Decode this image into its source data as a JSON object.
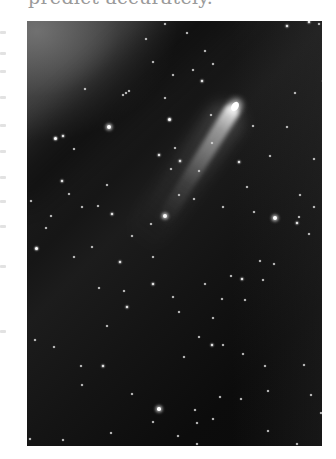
{
  "document": {
    "top_text": "predict accurately.",
    "text_color": "#9a9a9a",
    "margin_fragments_y": [
      31,
      52,
      70,
      96,
      124,
      150,
      176,
      200,
      225,
      265,
      330
    ]
  },
  "photo": {
    "subject": "comet in starry night sky",
    "alt": "Photograph of a comet with a long tail against a dark star field",
    "position": {
      "left": 27,
      "top": 21,
      "width": 295,
      "height": 425
    },
    "colors": {
      "sky_dark": "#0a0a0a",
      "glow_top_left": "#787878",
      "star": "#ffffff"
    },
    "comet": {
      "head": {
        "x": 208,
        "y": 85
      },
      "tail_angle_deg": 122,
      "tail_length": 140
    },
    "stars": [
      {
        "x": 82,
        "y": 106,
        "r": 2.2
      },
      {
        "x": 138,
        "y": 195,
        "r": 2.4
      },
      {
        "x": 138,
        "y": 3,
        "r": 1.2
      },
      {
        "x": 58,
        "y": 68,
        "r": 0.9
      },
      {
        "x": 160,
        "y": 12,
        "r": 1.2
      },
      {
        "x": 102,
        "y": 70,
        "r": 1.0
      },
      {
        "x": 99,
        "y": 72,
        "r": 1.0
      },
      {
        "x": 96,
        "y": 74,
        "r": 1.0
      },
      {
        "x": 119,
        "y": 18,
        "r": 1.0
      },
      {
        "x": 146,
        "y": 54,
        "r": 1.2
      },
      {
        "x": 178,
        "y": 30,
        "r": 1.1
      },
      {
        "x": 186,
        "y": 43,
        "r": 0.9
      },
      {
        "x": 175,
        "y": 60,
        "r": 1.3
      },
      {
        "x": 166,
        "y": 49,
        "r": 1.0
      },
      {
        "x": 126,
        "y": 41,
        "r": 1.0
      },
      {
        "x": 138,
        "y": 77,
        "r": 1.0
      },
      {
        "x": 142,
        "y": 98,
        "r": 1.5
      },
      {
        "x": 148,
        "y": 127,
        "r": 1.1
      },
      {
        "x": 132,
        "y": 134,
        "r": 1.3
      },
      {
        "x": 144,
        "y": 148,
        "r": 1.2
      },
      {
        "x": 152,
        "y": 174,
        "r": 1.0
      },
      {
        "x": 172,
        "y": 150,
        "r": 1.0
      },
      {
        "x": 28,
        "y": 117,
        "r": 1.5
      },
      {
        "x": 36,
        "y": 115,
        "r": 1.3
      },
      {
        "x": 47,
        "y": 128,
        "r": 1.1
      },
      {
        "x": 35,
        "y": 160,
        "r": 1.3
      },
      {
        "x": 42,
        "y": 173,
        "r": 1.1
      },
      {
        "x": 55,
        "y": 186,
        "r": 1.1
      },
      {
        "x": 4,
        "y": 180,
        "r": 1.2
      },
      {
        "x": 24,
        "y": 195,
        "r": 1.0
      },
      {
        "x": 71,
        "y": 185,
        "r": 1.2
      },
      {
        "x": 80,
        "y": 164,
        "r": 1.0
      },
      {
        "x": 85,
        "y": 193,
        "r": 1.3
      },
      {
        "x": 105,
        "y": 215,
        "r": 1.2
      },
      {
        "x": 93,
        "y": 241,
        "r": 1.3
      },
      {
        "x": 19,
        "y": 207,
        "r": 1.1
      },
      {
        "x": 9,
        "y": 227,
        "r": 1.5
      },
      {
        "x": 47,
        "y": 236,
        "r": 1.0
      },
      {
        "x": 65,
        "y": 226,
        "r": 1.0
      },
      {
        "x": 126,
        "y": 236,
        "r": 1.1
      },
      {
        "x": 124,
        "y": 203,
        "r": 1.0
      },
      {
        "x": 72,
        "y": 267,
        "r": 1.2
      },
      {
        "x": 97,
        "y": 270,
        "r": 1.1
      },
      {
        "x": 100,
        "y": 286,
        "r": 1.4
      },
      {
        "x": 126,
        "y": 263,
        "r": 1.3
      },
      {
        "x": 146,
        "y": 276,
        "r": 1.1
      },
      {
        "x": 152,
        "y": 291,
        "r": 1.0
      },
      {
        "x": 178,
        "y": 263,
        "r": 1.1
      },
      {
        "x": 186,
        "y": 297,
        "r": 1.2
      },
      {
        "x": 195,
        "y": 278,
        "r": 1.1
      },
      {
        "x": 215,
        "y": 258,
        "r": 1.3
      },
      {
        "x": 236,
        "y": 259,
        "r": 1.0
      },
      {
        "x": 248,
        "y": 197,
        "r": 2.0
      },
      {
        "x": 270,
        "y": 202,
        "r": 1.3
      },
      {
        "x": 227,
        "y": 191,
        "r": 1.0
      },
      {
        "x": 287,
        "y": 186,
        "r": 1.1
      },
      {
        "x": 273,
        "y": 174,
        "r": 1.0
      },
      {
        "x": 220,
        "y": 166,
        "r": 1.0
      },
      {
        "x": 212,
        "y": 141,
        "r": 1.3
      },
      {
        "x": 272,
        "y": 196,
        "r": 1.0
      },
      {
        "x": 226,
        "y": 105,
        "r": 1.1
      },
      {
        "x": 260,
        "y": 106,
        "r": 1.0
      },
      {
        "x": 243,
        "y": 135,
        "r": 1.2
      },
      {
        "x": 287,
        "y": 138,
        "r": 1.2
      },
      {
        "x": 196,
        "y": 186,
        "r": 0.9
      },
      {
        "x": 185,
        "y": 122,
        "r": 1.0
      },
      {
        "x": 153,
        "y": 140,
        "r": 1.3
      },
      {
        "x": 167,
        "y": 178,
        "r": 1.0
      },
      {
        "x": 184,
        "y": 94,
        "r": 1.0
      },
      {
        "x": 282,
        "y": 213,
        "r": 1.1
      },
      {
        "x": 204,
        "y": 255,
        "r": 1.2
      },
      {
        "x": 233,
        "y": 240,
        "r": 1.0
      },
      {
        "x": 247,
        "y": 243,
        "r": 1.0
      },
      {
        "x": 296,
        "y": 60,
        "r": 1.0
      },
      {
        "x": 268,
        "y": 72,
        "r": 1.0
      },
      {
        "x": 282,
        "y": 1,
        "r": 1.3
      },
      {
        "x": 292,
        "y": 3,
        "r": 1.0
      },
      {
        "x": 298,
        "y": 4,
        "r": 1.0
      },
      {
        "x": 260,
        "y": 5,
        "r": 1.3
      },
      {
        "x": 76,
        "y": 345,
        "r": 1.4
      },
      {
        "x": 27,
        "y": 326,
        "r": 1.1
      },
      {
        "x": 54,
        "y": 345,
        "r": 1.0
      },
      {
        "x": 105,
        "y": 373,
        "r": 1.0
      },
      {
        "x": 84,
        "y": 412,
        "r": 1.0
      },
      {
        "x": 132,
        "y": 388,
        "r": 1.7
      },
      {
        "x": 126,
        "y": 401,
        "r": 1.1
      },
      {
        "x": 151,
        "y": 415,
        "r": 1.1
      },
      {
        "x": 129,
        "y": 440,
        "r": 1.2
      },
      {
        "x": 86,
        "y": 436,
        "r": 1.0
      },
      {
        "x": 47,
        "y": 438,
        "r": 1.0
      },
      {
        "x": 36,
        "y": 419,
        "r": 1.0
      },
      {
        "x": 8,
        "y": 319,
        "r": 1.0
      },
      {
        "x": 55,
        "y": 364,
        "r": 1.0
      },
      {
        "x": 80,
        "y": 305,
        "r": 1.0
      },
      {
        "x": 185,
        "y": 324,
        "r": 1.4
      },
      {
        "x": 196,
        "y": 324,
        "r": 1.2
      },
      {
        "x": 172,
        "y": 316,
        "r": 1.0
      },
      {
        "x": 157,
        "y": 336,
        "r": 1.1
      },
      {
        "x": 216,
        "y": 333,
        "r": 1.1
      },
      {
        "x": 238,
        "y": 345,
        "r": 1.0
      },
      {
        "x": 277,
        "y": 344,
        "r": 1.2
      },
      {
        "x": 284,
        "y": 374,
        "r": 1.0
      },
      {
        "x": 241,
        "y": 370,
        "r": 1.1
      },
      {
        "x": 214,
        "y": 378,
        "r": 1.0
      },
      {
        "x": 193,
        "y": 376,
        "r": 1.0
      },
      {
        "x": 168,
        "y": 389,
        "r": 1.0
      },
      {
        "x": 186,
        "y": 398,
        "r": 1.1
      },
      {
        "x": 170,
        "y": 402,
        "r": 1.0
      },
      {
        "x": 270,
        "y": 423,
        "r": 1.1
      },
      {
        "x": 170,
        "y": 423,
        "r": 1.1
      },
      {
        "x": 208,
        "y": 427,
        "r": 1.0
      },
      {
        "x": 241,
        "y": 410,
        "r": 1.1
      },
      {
        "x": 294,
        "y": 392,
        "r": 1.0
      },
      {
        "x": 3,
        "y": 418,
        "r": 1.0
      },
      {
        "x": 218,
        "y": 279,
        "r": 1.0
      }
    ]
  }
}
